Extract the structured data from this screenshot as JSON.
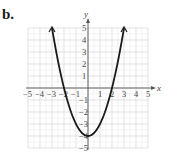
{
  "figure_label": "b.",
  "chart_data": {
    "type": "line",
    "title": "",
    "function": "y = x^2 - 4",
    "xlabel": "x",
    "ylabel": "y",
    "xlim": [
      -5,
      5
    ],
    "ylim": [
      -5,
      5
    ],
    "grid": true,
    "x_ticks": [
      -5,
      -4,
      -3,
      -2,
      -1,
      1,
      2,
      3,
      4,
      5
    ],
    "y_ticks": [
      -5,
      -4,
      -3,
      -2,
      -1,
      1,
      2,
      3,
      4,
      5
    ],
    "series": [
      {
        "name": "parabola",
        "x": [
          -3,
          -2,
          -1,
          0,
          1,
          2,
          3
        ],
        "values": [
          5,
          0,
          -3,
          -4,
          -3,
          0,
          5
        ],
        "arrows_at_ends": true,
        "color": "#1a1a1a"
      }
    ],
    "key_points": {
      "vertex": [
        0,
        -4
      ],
      "x_intercepts": [
        -2,
        2
      ],
      "y_intercept": -4
    }
  }
}
